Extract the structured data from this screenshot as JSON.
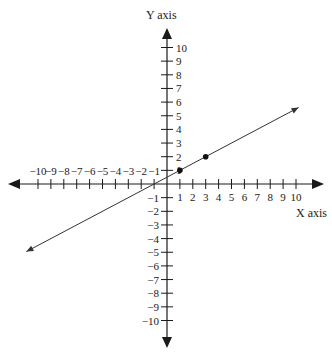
{
  "chart_data": {
    "type": "line",
    "title": "",
    "xlabel": "X axis",
    "ylabel": "Y axis",
    "xlim": [
      -10,
      10
    ],
    "ylim": [
      -10,
      10
    ],
    "grid": false,
    "legend": null,
    "x_ticks": [
      -10,
      -9,
      -8,
      -7,
      -6,
      -5,
      -4,
      -3,
      -2,
      -1,
      1,
      2,
      3,
      4,
      5,
      6,
      7,
      8,
      9,
      10
    ],
    "y_ticks": [
      10,
      9,
      8,
      7,
      6,
      5,
      4,
      3,
      2,
      1,
      -1,
      -2,
      -3,
      -4,
      -5,
      -6,
      -7,
      -8,
      -9,
      -10
    ],
    "series": [
      {
        "name": "line",
        "description": "Straight line through (1,1) and (3,2), arrows at both ends",
        "slope": 0.5,
        "intercept": 0.5,
        "points": [
          {
            "x": 1,
            "y": 1
          },
          {
            "x": 3,
            "y": 2
          }
        ]
      }
    ]
  },
  "colors": {
    "axis": "#1a1a1a",
    "line": "#333333",
    "point": "#111111",
    "background": "#ffffff"
  },
  "labels": {
    "x_axis_title": "X axis",
    "y_axis_title": "Y axis"
  }
}
